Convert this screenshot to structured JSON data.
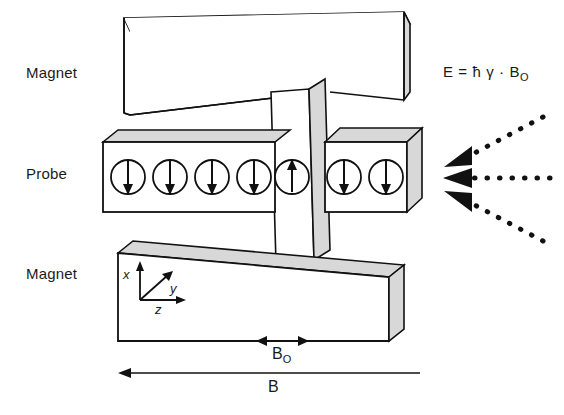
{
  "diagram": {
    "labels": {
      "magnet_top": "Magnet",
      "probe": "Probe",
      "magnet_bottom": "Magnet"
    },
    "formula": {
      "text": "E = ħ γ · B",
      "subscript": "O"
    },
    "axes": {
      "x": "x",
      "y": "y",
      "z": "z"
    },
    "fields": {
      "b0_label": "B",
      "b0_sub": "O",
      "b_label": "B"
    },
    "spins": {
      "down_left_count": 4,
      "up_center_count": 1,
      "down_right_count": 2,
      "down_glyph": "spin-down-arrow",
      "up_glyph": "spin-up-arrow"
    },
    "rf_arrows": {
      "count": 3,
      "style": "dotted-arrow-pointing-left",
      "names": [
        "rf-arrow-upper",
        "rf-arrow-middle",
        "rf-arrow-lower"
      ]
    },
    "colors": {
      "stroke": "#111111",
      "face_shade": "#d8d8d8",
      "face_light": "#ffffff",
      "text": "#1a1a1a",
      "background": "#ffffff"
    }
  }
}
